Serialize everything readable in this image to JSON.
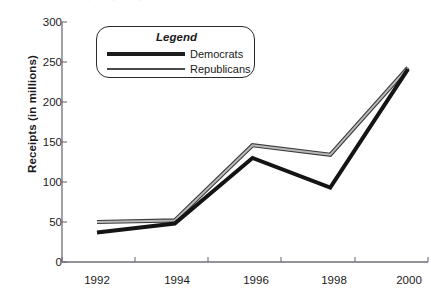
{
  "figure": {
    "clipped_title": "Receipts by Party Committees",
    "ylabel": "Receipts (in millions)"
  },
  "legend": {
    "title": "Legend",
    "democrats_label": "Democrats",
    "republicans_label": "Republicans",
    "democrats_color": "#1c1c1c",
    "republicans_color": "#7b7b7b"
  },
  "chart_data": {
    "type": "line",
    "title": "Receipts by Party Committees",
    "xlabel": "",
    "ylabel": "Receipts (in millions)",
    "categories": [
      "1992",
      "1994",
      "1996",
      "1998",
      "2000"
    ],
    "x": [
      1992,
      1994,
      1996,
      1998,
      2000
    ],
    "series": [
      {
        "name": "Democrats",
        "color": "#1c1c1c",
        "values": [
          37,
          48,
          130,
          93,
          241
        ]
      },
      {
        "name": "Republicans",
        "color": "#7b7b7b",
        "values": [
          50,
          52,
          146,
          134,
          243
        ]
      }
    ],
    "ylim": [
      0,
      300
    ],
    "yticks": [
      0,
      50,
      100,
      150,
      200,
      250,
      300
    ],
    "ytick_labels": [
      "0",
      "50",
      "100",
      "150",
      "200",
      "250",
      "300"
    ],
    "xtick_labels": [
      "1992",
      "1994",
      "1996",
      "1998",
      "2000"
    ],
    "grid": false,
    "legend_position": "upper-left-inside"
  }
}
